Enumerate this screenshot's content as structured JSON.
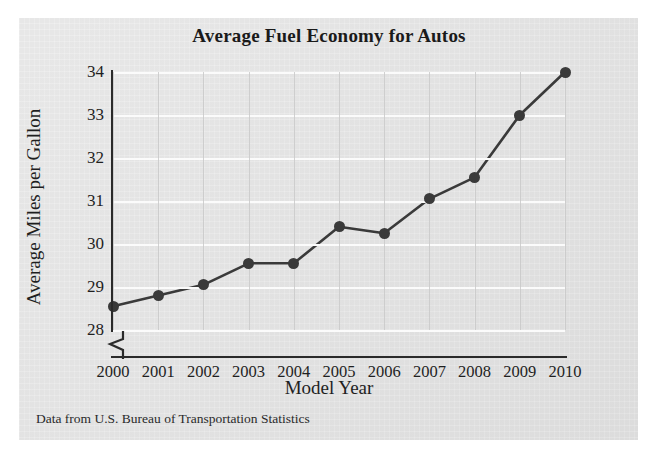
{
  "chart_data": {
    "type": "line",
    "title": "Average Fuel Economy for Autos",
    "xlabel": "Model Year",
    "ylabel": "Average Miles per Gallon",
    "source_note": "Data from U.S. Bureau of Transportation Statistics",
    "categories": [
      "2000",
      "2001",
      "2002",
      "2003",
      "2004",
      "2005",
      "2006",
      "2007",
      "2008",
      "2009",
      "2010"
    ],
    "x": [
      2000,
      2001,
      2002,
      2003,
      2004,
      2005,
      2006,
      2007,
      2008,
      2009,
      2010
    ],
    "values": [
      28.55,
      28.8,
      29.05,
      29.55,
      29.55,
      30.4,
      30.25,
      31.05,
      31.55,
      33.0,
      34.0
    ],
    "series": [
      {
        "name": "Average Miles per Gallon",
        "values": [
          28.55,
          28.8,
          29.05,
          29.55,
          29.55,
          30.4,
          30.25,
          31.05,
          31.55,
          33.0,
          34.0
        ]
      }
    ],
    "ylim": [
      28,
      34
    ],
    "yticks": [
      28,
      29,
      30,
      31,
      32,
      33,
      34
    ],
    "ytick_labels": [
      "28",
      "29",
      "30",
      "31",
      "32",
      "33",
      "34"
    ],
    "xlim": [
      2000,
      2010
    ],
    "grid": true,
    "grid_horizontal": true,
    "grid_vertical": true,
    "legend": "none",
    "axis_break": true,
    "marker": "filled-circle",
    "colors": {
      "line": "#3a3a3a",
      "marker": "#3a3a3a",
      "panel_background": "#e3e3e3",
      "page_background": "#ffffff",
      "axis": "#2b2b2b",
      "horizontal_gridline": "#fbfbfb",
      "vertical_gridline": "#c9c9c9",
      "text": "#1f1f1f"
    }
  }
}
